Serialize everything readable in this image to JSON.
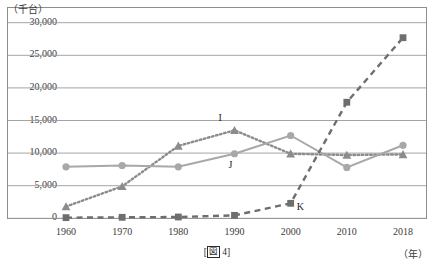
{
  "figure": {
    "caption_prefix": "[",
    "caption_label": "図",
    "caption_number": "4",
    "caption_suffix": "]"
  },
  "axes": {
    "y_unit_label": "（千台）",
    "x_unit_label": "（年）"
  },
  "colors": {
    "series_I": "#8c8c8c",
    "series_J": "#a8a8a8",
    "series_K": "#6e6e6e",
    "gridline": "#9a9a9a",
    "frame": "#8d8d8d",
    "text": "#333333"
  },
  "chart_data": {
    "type": "line",
    "title": "",
    "xlabel": "（年）",
    "ylabel": "（千台）",
    "x": [
      1960,
      1970,
      1980,
      1990,
      2000,
      2010,
      2018
    ],
    "categories": [
      "1960",
      "1970",
      "1980",
      "1990",
      "2000",
      "2010",
      "2018"
    ],
    "ylim": [
      0,
      30000
    ],
    "yticks": [
      0,
      5000,
      10000,
      15000,
      20000,
      25000,
      30000
    ],
    "ytick_labels": [
      "0",
      "5,000",
      "10,000",
      "15,000",
      "20,000",
      "25,000",
      "30,000"
    ],
    "grid": true,
    "legend": "inline-annotations",
    "series": [
      {
        "name": "I",
        "marker": "triangle",
        "linestyle": "dotted",
        "color": "#8c8c8c",
        "values": [
          1800,
          4900,
          11100,
          13500,
          9900,
          9700,
          9800
        ],
        "label_x": 1990,
        "label_text": "I"
      },
      {
        "name": "J",
        "marker": "circle",
        "linestyle": "solid",
        "color": "#a8a8a8",
        "values": [
          7900,
          8100,
          7900,
          9900,
          12700,
          7800,
          11200
        ],
        "label_x": 1990,
        "label_text": "J"
      },
      {
        "name": "K",
        "marker": "square",
        "linestyle": "dashed",
        "color": "#6e6e6e",
        "values": [
          100,
          150,
          200,
          450,
          2300,
          17800,
          27700
        ],
        "label_x": 2000,
        "label_text": "K"
      }
    ],
    "annotations": [
      {
        "text": "I",
        "series": "I",
        "at_x": 1990
      },
      {
        "text": "J",
        "series": "J",
        "at_x": 1990
      },
      {
        "text": "K",
        "series": "K",
        "at_x": 2000
      }
    ]
  }
}
